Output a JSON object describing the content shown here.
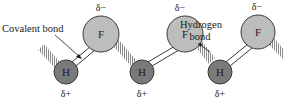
{
  "diagram": {
    "labels": {
      "covalent_bond": "Covalent bond",
      "hydrogen_bond_line1": "Hydrogen",
      "hydrogen_bond_line2": "bond"
    },
    "atoms": {
      "hydrogen_symbol": "H",
      "fluorine_symbol": "F",
      "partial_positive": "δ+",
      "partial_negative": "δ−"
    },
    "molecules": [
      {
        "h": "H",
        "f": "F",
        "h_charge": "δ+",
        "f_charge": "δ−"
      },
      {
        "h": "H",
        "f": "F",
        "h_charge": "δ+",
        "f_charge": "δ−"
      },
      {
        "h": "H",
        "f": "F",
        "h_charge": "δ+",
        "f_charge": "δ−"
      }
    ],
    "colors": {
      "hydrogen_fill": "#7a7a7a",
      "fluorine_fill": "#bdbdbd",
      "outline": "#3a3a3a",
      "hatch": "#8a8a8a"
    }
  }
}
